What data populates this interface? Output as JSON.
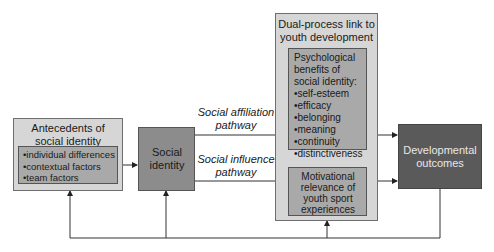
{
  "antecedents": {
    "title": "Antecedents of social identity",
    "items": [
      "individual differences",
      "contextual factors",
      "team factors"
    ]
  },
  "social_identity": {
    "label": "Social identity"
  },
  "pathways": {
    "affiliation": "Social affiliation pathway",
    "influence": "Social influence pathway"
  },
  "dual_process": {
    "title": "Dual-process link to youth development",
    "benefits": {
      "title": "Psychological benefits of social identity:",
      "items": [
        "self-esteem",
        "efficacy",
        "belonging",
        "meaning",
        "continuity",
        "distinctiveness"
      ]
    },
    "motivational": "Motivational relevance of youth sport experiences"
  },
  "outcomes": {
    "label": "Developmental outcomes"
  },
  "colors": {
    "outer_box": "#d6d6d6",
    "inner_box": "#a9a9a9",
    "social_identity": "#8c8c8c",
    "outcomes": "#5a5a5a",
    "line": "#333333"
  }
}
